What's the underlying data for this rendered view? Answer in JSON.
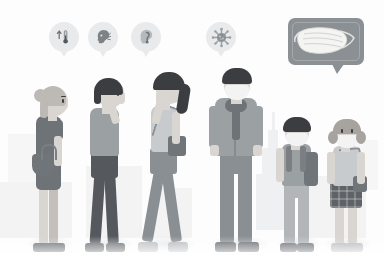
{
  "illustration": {
    "title": "COVID-19 symptoms and face mask prevention illustration",
    "style": "grayscale flat vector",
    "background_color": "#ffffff",
    "accent_color": "#8b9094",
    "skyline_color": "#9aa0a4"
  },
  "symptom_bubbles": [
    {
      "id": "fever",
      "icon": "thermometer-icon",
      "label": "Fever",
      "x": 49,
      "y": 22,
      "bubble_color": "#e9eaeb",
      "icon_color": "#7d8286"
    },
    {
      "id": "cough",
      "icon": "head-cough-icon",
      "label": "Cough",
      "x": 88,
      "y": 22,
      "bubble_color": "#e9eaeb",
      "icon_color": "#7d8286"
    },
    {
      "id": "sore-throat",
      "icon": "head-throat-icon",
      "label": "Sore throat",
      "x": 131,
      "y": 22,
      "bubble_color": "#e9eaeb",
      "icon_color": "#9b9fa2"
    },
    {
      "id": "virus",
      "icon": "virus-icon",
      "label": "Virus",
      "x": 206,
      "y": 22,
      "bubble_color": "#e9eaeb",
      "icon_color": "#9b9fa2"
    }
  ],
  "mask_callout": {
    "icon": "face-mask-icon",
    "label": "Wear a face mask",
    "bubble_color": "#8b9094",
    "mask_color": "#f4f4f2"
  },
  "skyline": {
    "landmark": "Empire State Building silhouette",
    "opacity": "faint"
  },
  "people": [
    {
      "id": "woman-bun",
      "label": "Woman with bun, handbag",
      "masked": false,
      "pose": "standing in profile",
      "hair": "light bun",
      "top": "dark gray tee",
      "bottom": "dark gray skirt",
      "accessory": "shoulder handbag",
      "x": 22,
      "height": 200
    },
    {
      "id": "man-coughing",
      "label": "Man covering mouth",
      "masked": false,
      "pose": "hand to mouth",
      "hair": "dark short",
      "top": "gray tee",
      "bottom": "dark trousers",
      "accessory": "none",
      "x": 80,
      "height": 203
    },
    {
      "id": "woman-ponytail",
      "label": "Woman with ponytail",
      "masked": false,
      "pose": "hand to face",
      "hair": "dark ponytail",
      "top": "light tank top",
      "bottom": "dark leggings",
      "accessory": "crossbody bag",
      "x": 138,
      "height": 206
    },
    {
      "id": "man-masked",
      "label": "Man wearing face mask",
      "masked": true,
      "pose": "standing front",
      "hair": "dark short",
      "top": "gray jacket",
      "bottom": "gray trousers",
      "accessory": "scarf",
      "x": 206,
      "height": 208
    },
    {
      "id": "boy-masked",
      "label": "Boy wearing face mask",
      "masked": true,
      "pose": "standing front",
      "hair": "dark bowl cut",
      "top": "gray tee",
      "bottom": "gray trousers",
      "accessory": "backpack",
      "x": 274,
      "height": 160
    },
    {
      "id": "girl-masked",
      "label": "Girl wearing face mask",
      "masked": true,
      "pose": "standing front",
      "hair": "pigtails",
      "top": "light top",
      "bottom": "plaid skirt",
      "accessory": "satchel bag",
      "x": 322,
      "height": 156
    }
  ]
}
